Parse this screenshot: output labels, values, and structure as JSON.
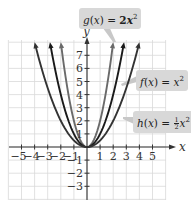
{
  "chart_data": {
    "type": "line",
    "title": "",
    "xlabel": "x",
    "ylabel": "y",
    "xlim": [
      -6.1,
      6
    ],
    "ylim": [
      -4.1,
      8.2
    ],
    "grid": true,
    "x_ticks": [
      -5,
      -4,
      -3,
      -2,
      -1,
      1,
      2,
      3,
      4,
      5
    ],
    "y_ticks": [
      -3,
      -2,
      -1,
      1,
      2,
      3,
      4,
      5,
      6,
      7
    ],
    "series": [
      {
        "name": "g(x) = 2x^2",
        "coefficient": 2,
        "color": "#6a6a6a",
        "label_text": "g(x) = 2x²"
      },
      {
        "name": "f(x) = x^2",
        "coefficient": 1,
        "color": "#1a1a1a",
        "label_text": "f(x) = x²"
      },
      {
        "name": "h(x) = 1/2 x^2",
        "coefficient": 0.5,
        "color": "#333333",
        "label_text": "h(x) = ½x²"
      }
    ],
    "annotations": [
      {
        "text": "g(x) = 2x²",
        "points_to": "g"
      },
      {
        "text": "f(x) = x²",
        "points_to": "f"
      },
      {
        "text": "h(x) = ½x²",
        "points_to": "h"
      }
    ]
  },
  "labels": {
    "g": {
      "fn": "g",
      "var": "x",
      "coef": "2",
      "var2": "x",
      "exp": "2"
    },
    "f": {
      "fn": "f",
      "var": "x",
      "var2": "x",
      "exp": "2"
    },
    "h": {
      "fn": "h",
      "var": "x",
      "num": "1",
      "den": "2",
      "var2": "x",
      "exp": "2"
    }
  },
  "axes": {
    "x_name": "x",
    "y_name": "y"
  },
  "colors": {
    "grid": "#d9d9d9",
    "axis": "#333333",
    "callout_bg": "#d8d8d8"
  }
}
